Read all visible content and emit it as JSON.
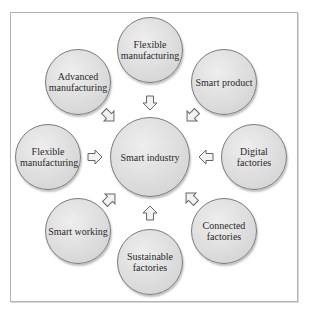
{
  "diagram": {
    "type": "hub-and-spoke",
    "hub": {
      "label": "Smart industry"
    },
    "satellites": [
      {
        "position": "top",
        "label": "Flexible manufacturing"
      },
      {
        "position": "top-right",
        "label": "Smart product"
      },
      {
        "position": "right",
        "label": "Digital factories"
      },
      {
        "position": "bottom-right",
        "label": "Connected factories"
      },
      {
        "position": "bottom",
        "label": "Sustainable factories"
      },
      {
        "position": "bottom-left",
        "label": "Smart working"
      },
      {
        "position": "left",
        "label": "Flexible manufacturing"
      },
      {
        "position": "top-left",
        "label": "Advanced manufacturing"
      }
    ],
    "arrow_direction": "toward-hub",
    "colors": {
      "circle_fill": "#e0e0e0",
      "circle_stroke": "#7a7a7a",
      "arrow_fill": "#f2f2f2",
      "arrow_stroke": "#666666",
      "frame_border": "#b4b4b4",
      "text": "#2a2a2a"
    }
  }
}
